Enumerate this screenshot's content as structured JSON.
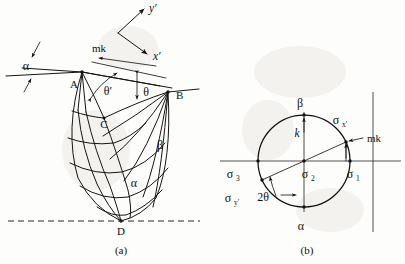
{
  "figure": {
    "captions": {
      "left": "(a)",
      "right": "(b)"
    }
  },
  "panel_a": {
    "name": "slip-line-field",
    "points": [
      {
        "id": "A",
        "label": "A",
        "x": 82,
        "y": 72
      },
      {
        "id": "B",
        "label": "B",
        "x": 168,
        "y": 92
      },
      {
        "id": "C",
        "label": "C",
        "x": 104,
        "y": 118
      },
      {
        "id": "D",
        "label": "D",
        "x": 121,
        "y": 221
      }
    ],
    "angles": [
      {
        "id": "alpha-surface",
        "label": "α",
        "x": 26,
        "y": 62
      },
      {
        "id": "theta-prime",
        "label": "θ′",
        "x": 108,
        "y": 90
      },
      {
        "id": "theta",
        "label": "θ",
        "x": 143,
        "y": 92
      },
      {
        "id": "beta-family",
        "label": "β",
        "x": 159,
        "y": 145
      },
      {
        "id": "alpha-family",
        "label": "α",
        "x": 133,
        "y": 183
      }
    ],
    "traction": {
      "label": "mk",
      "x": 112,
      "y": 56
    },
    "axes": {
      "x_label": "x′",
      "x_label_x": 152,
      "x_label_y": 58,
      "y_label": "y′",
      "y_label_x": 152,
      "y_label_y": 17
    }
  },
  "panel_b": {
    "name": "mohr-circle",
    "center": {
      "x": 304,
      "y": 161
    },
    "radius": 46,
    "labels": [
      {
        "id": "sigma-1",
        "label": "σ",
        "sub": "1",
        "x": 354,
        "y": 176
      },
      {
        "id": "sigma-2",
        "label": "σ",
        "sub": "2",
        "x": 309,
        "y": 176
      },
      {
        "id": "sigma-3",
        "label": "σ",
        "sub": "3",
        "x": 228,
        "y": 176
      },
      {
        "id": "sigma-x-prime",
        "label": "σ",
        "sub": "x′",
        "x": 337,
        "y": 118
      },
      {
        "id": "sigma-y-prime",
        "label": "σ",
        "sub": "y′",
        "x": 226,
        "y": 200
      },
      {
        "id": "beta-top",
        "label": "β",
        "x": 300,
        "y": 103
      },
      {
        "id": "alpha-bottom",
        "label": "α",
        "x": 301,
        "y": 228
      },
      {
        "id": "k-vertical",
        "label": "k",
        "x": 297,
        "y": 131
      },
      {
        "id": "mk-radial",
        "label": "mk",
        "x": 366,
        "y": 140
      },
      {
        "id": "two-theta",
        "label": "2θ",
        "x": 262,
        "y": 198
      }
    ],
    "two_theta_deg": 62
  },
  "colors": {
    "ink": "#111111",
    "axis": "#3a3a3a",
    "paper": "#fdfdfc"
  }
}
